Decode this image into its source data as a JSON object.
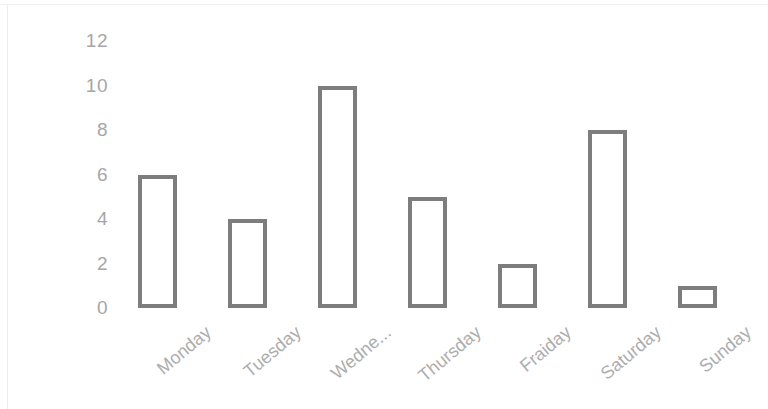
{
  "chart_data": {
    "type": "bar",
    "title": "",
    "subtitle": "",
    "xlabel": "",
    "ylabel": "",
    "categories": [
      "Monday",
      "Tuesday",
      "Wedne...",
      "Thursday",
      "Fraiday",
      "Saturday",
      "Sunday"
    ],
    "values": [
      6,
      4,
      10,
      5,
      2,
      8,
      1
    ],
    "ylim": [
      0,
      12
    ],
    "ytick_labels": [
      "12",
      "10",
      "8",
      "6",
      "4",
      "2",
      "0"
    ],
    "ytick_values": [
      12,
      10,
      8,
      6,
      4,
      2,
      0
    ],
    "grid": false,
    "legend": false,
    "legend_position": "none",
    "bar_fill_color": "#ffffff",
    "bar_border_color": "#7d7d7d",
    "axis_label_color": "#a6a6a6",
    "category_label_color": "#adadad",
    "background_color": "#ffffff",
    "category_label_rotation": -40
  }
}
